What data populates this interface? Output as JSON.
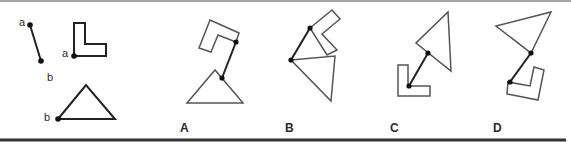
{
  "figure": {
    "given": {
      "segment": {
        "label_start": "a",
        "label_end": "b"
      },
      "l_shape": {
        "attach_label": "a"
      },
      "triangle": {
        "attach_label": "b"
      }
    },
    "options": [
      {
        "label": "A"
      },
      {
        "label": "B"
      },
      {
        "label": "C"
      },
      {
        "label": "D"
      }
    ]
  },
  "colors": {
    "stroke": "#222222",
    "light_stroke": "#555555",
    "border": "#333333",
    "background": "#ffffff"
  }
}
